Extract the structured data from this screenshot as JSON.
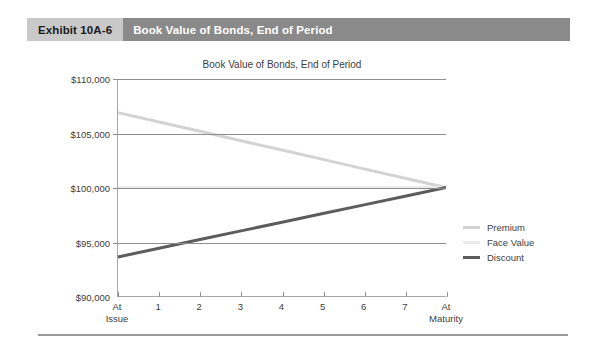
{
  "exhibit": {
    "number_label": "Exhibit 10A-6",
    "title": "Book Value of Bonds, End of Period",
    "number_bg": "#c9c9c9",
    "title_bg": "#8a8a8a"
  },
  "chart_data": {
    "type": "line",
    "title": "Book Value of Bonds, End of Period",
    "xlabel": "",
    "ylabel": "",
    "x": [
      "At Issue",
      "1",
      "2",
      "3",
      "4",
      "5",
      "6",
      "7",
      "At Maturity"
    ],
    "categories": [
      "At Issue",
      "1",
      "2",
      "3",
      "4",
      "5",
      "6",
      "7",
      "At Maturity"
    ],
    "ylim": [
      90000,
      110000
    ],
    "yticks": [
      90000,
      95000,
      100000,
      105000,
      110000
    ],
    "ytick_labels": [
      "$90,000",
      "$95,000",
      "$100,000",
      "$105,000",
      "$110,000"
    ],
    "grid": true,
    "grid_axis": "y",
    "legend_position": "right",
    "series": [
      {
        "name": "Premium",
        "color": "#d3d3d3",
        "values": [
          106900,
          106040,
          105180,
          104310,
          103450,
          102590,
          101720,
          100860,
          100000
        ]
      },
      {
        "name": "Face Value",
        "color": "#ebebeb",
        "values": [
          100000,
          100000,
          100000,
          100000,
          100000,
          100000,
          100000,
          100000,
          100000
        ]
      },
      {
        "name": "Discount",
        "color": "#5c5c5c",
        "values": [
          93600,
          94400,
          95200,
          96000,
          96800,
          97600,
          98400,
          99200,
          100000
        ]
      }
    ]
  },
  "legend": {
    "items": [
      {
        "label": "Premium",
        "color": "#d3d3d3"
      },
      {
        "label": "Face Value",
        "color": "#ebebeb"
      },
      {
        "label": "Discount",
        "color": "#5c5c5c"
      }
    ]
  }
}
